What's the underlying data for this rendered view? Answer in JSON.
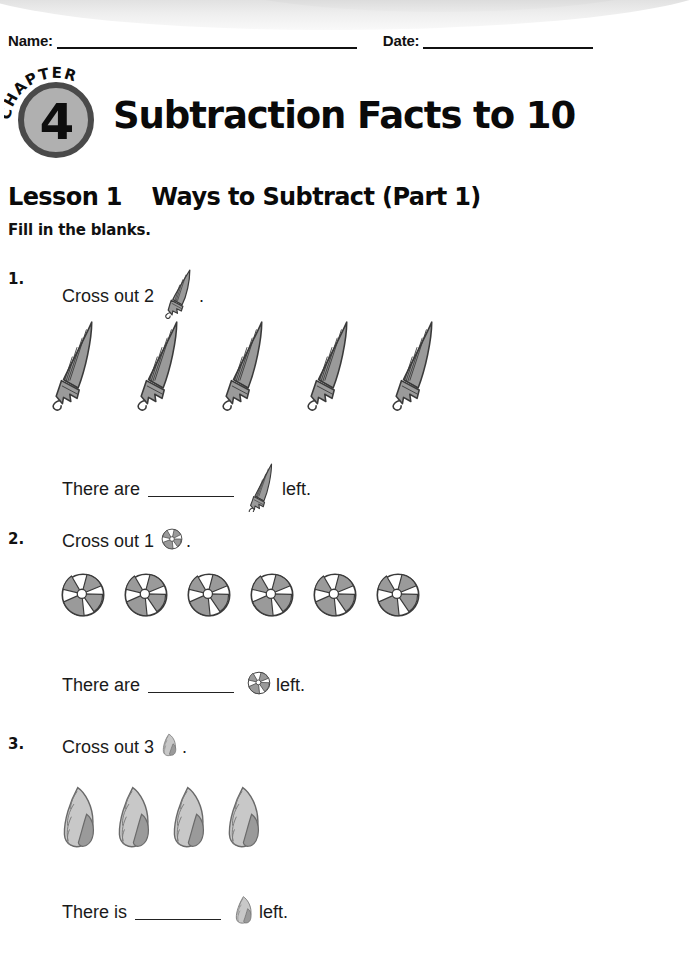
{
  "worksheet": {
    "name_label": "Name:",
    "date_label": "Date:",
    "chapter_word": "CHAPTER",
    "chapter_number": "4",
    "title": "Subtraction Facts to 10",
    "lesson_label": "Lesson 1",
    "lesson_title": "Ways to Subtract (Part 1)",
    "instruction": "Fill in the blanks."
  },
  "colors": {
    "badge_fill": "#b0b0b0",
    "badge_ring": "#4a4a4a",
    "object_gray": "#9a9a9a",
    "object_light": "#c8c8c8",
    "outline": "#3a3a3a",
    "text": "#1a1a1a"
  },
  "questions": [
    {
      "number": "1.",
      "prompt_text": "Cross out 2",
      "prompt_icon": "umbrella-icon",
      "prompt_period": ".",
      "object_name": "umbrella",
      "object_count": 5,
      "answer_prefix": "There are",
      "answer_suffix": "left.",
      "answer_value": ""
    },
    {
      "number": "2.",
      "prompt_text": "Cross out 1",
      "prompt_icon": "beach-ball-icon",
      "prompt_period": ".",
      "object_name": "beach-ball",
      "object_count": 6,
      "answer_prefix": "There are",
      "answer_suffix": "left.",
      "answer_value": ""
    },
    {
      "number": "3.",
      "prompt_text": "Cross out 3",
      "prompt_icon": "seashell-icon",
      "prompt_period": ".",
      "object_name": "seashell",
      "object_count": 4,
      "answer_prefix": "There is",
      "answer_suffix": "left.",
      "answer_value": ""
    }
  ]
}
